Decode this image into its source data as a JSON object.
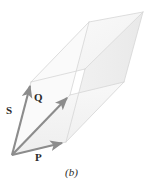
{
  "figure": {
    "panel_label": "(b)",
    "caption_style": "italic-parenthetical",
    "background_color": "#ffffff",
    "vector_color": "#8c8c8c",
    "edge_color": "#d8d8d8",
    "face_color": "#f4f4f4",
    "text_color": "#2b2b2b",
    "labels": {
      "s": "S",
      "q": "Q",
      "p": "P"
    },
    "vectors": [
      {
        "name": "S",
        "label": "S",
        "origin": [
          12,
          155
        ],
        "tip": [
          31,
          82
        ],
        "label_position": [
          8,
          110
        ]
      },
      {
        "name": "Q",
        "label": "Q",
        "origin": [
          12,
          155
        ],
        "tip": [
          70,
          95
        ],
        "label_position": [
          36,
          98
        ]
      },
      {
        "name": "P",
        "label": "P",
        "origin": [
          12,
          155
        ],
        "tip": [
          66,
          142
        ],
        "label_position": [
          37,
          158
        ]
      }
    ],
    "solid_vertices": {
      "origin": [
        12,
        155
      ],
      "p": [
        66,
        142
      ],
      "q": [
        70,
        95
      ],
      "s": [
        31,
        82
      ],
      "pq": [
        124,
        82
      ],
      "ps": [
        85,
        69
      ],
      "qs": [
        89,
        22
      ],
      "pqs": [
        143,
        12
      ]
    }
  }
}
